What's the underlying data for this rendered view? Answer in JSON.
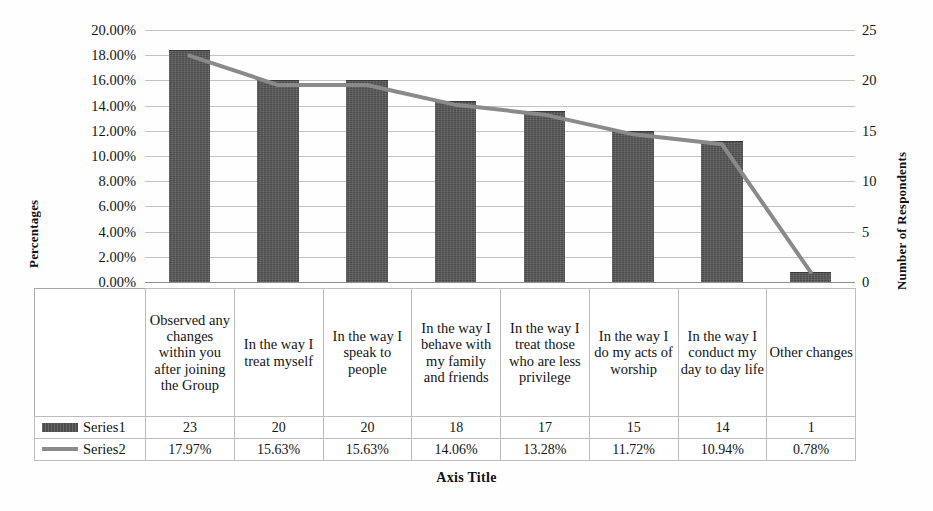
{
  "chart_data": {
    "type": "bar",
    "title": "",
    "xlabel": "Axis Title",
    "ylabel": "Percentages",
    "y2label": "Number of Respondents",
    "ylim": [
      0,
      20
    ],
    "y2lim": [
      0,
      25
    ],
    "grid": true,
    "legend_position": "data-table",
    "categories": [
      "Observed any changes within you after joining the Group",
      "In the way I treat myself",
      "In the way I speak to people",
      "In the way I behave with my family and friends",
      "In the way I treat those who are less privilege",
      "In the way I do my acts of worship",
      "In the way I conduct my day to day life",
      "Other changes"
    ],
    "series": [
      {
        "name": "Series1",
        "type": "bar",
        "axis": "right",
        "values": [
          23,
          20,
          20,
          18,
          17,
          15,
          14,
          1
        ],
        "labels": [
          "23",
          "20",
          "20",
          "18",
          "17",
          "15",
          "14",
          "1"
        ],
        "color": "#4c4c4c"
      },
      {
        "name": "Series2",
        "type": "line",
        "axis": "left",
        "values": [
          17.97,
          15.63,
          15.63,
          14.06,
          13.28,
          11.72,
          10.94,
          0.78
        ],
        "labels": [
          "17.97%",
          "15.63%",
          "15.63%",
          "14.06%",
          "13.28%",
          "11.72%",
          "10.94%",
          "0.78%"
        ],
        "color": "#8a8a8a"
      }
    ],
    "yticks_left": [
      "0.00%",
      "2.00%",
      "4.00%",
      "6.00%",
      "8.00%",
      "10.00%",
      "12.00%",
      "14.00%",
      "16.00%",
      "18.00%",
      "20.00%"
    ],
    "yticks_left_values": [
      0,
      2,
      4,
      6,
      8,
      10,
      12,
      14,
      16,
      18,
      20
    ],
    "yticks_right": [
      "0",
      "5",
      "10",
      "15",
      "20",
      "25"
    ],
    "yticks_right_values": [
      0,
      5,
      10,
      15,
      20,
      25
    ]
  },
  "axes": {
    "left_title": "Percentages",
    "right_title": "Number of Respondents",
    "bottom_title": "Axis Title"
  },
  "data_table": {
    "rows": [
      {
        "legend": "Series1",
        "marker": "bar-swatch",
        "cells": [
          "23",
          "20",
          "20",
          "18",
          "17",
          "15",
          "14",
          "1"
        ]
      },
      {
        "legend": "Series2",
        "marker": "line-swatch",
        "cells": [
          "17.97%",
          "15.63%",
          "15.63%",
          "14.06%",
          "13.28%",
          "11.72%",
          "10.94%",
          "0.78%"
        ]
      }
    ],
    "category_cells": [
      "Observed any changes within you after joining the Group",
      "In the way I treat myself",
      "In the way I speak to people",
      "In the way I behave with my family and friends",
      "In the way I treat those who are less privilege",
      "In the way I do my acts of worship",
      "In the way I conduct my day to day life",
      "Other changes"
    ]
  },
  "colors": {
    "bar": "#4c4c4c",
    "line": "#8a8a8a",
    "gridline": "#b9b9b9",
    "text": "#141414",
    "background": "#fefefe"
  }
}
